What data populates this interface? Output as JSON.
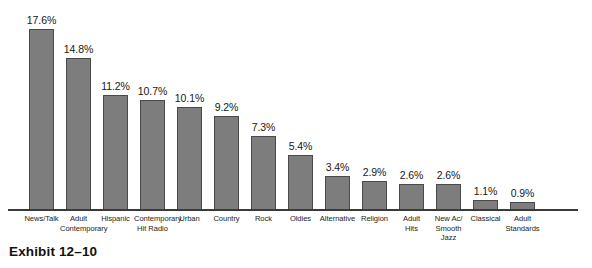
{
  "caption": "Exhibit 12–10",
  "chart_data": {
    "type": "bar",
    "title": "",
    "subtitle": "",
    "xlabel": "",
    "ylabel": "",
    "ylim": [
      0,
      17.6
    ],
    "grid": false,
    "legend": false,
    "value_suffix": "%",
    "bar_color": "#7d7d7d",
    "bar_border_color": "#4a4a4a",
    "axis_color": "#3a3a3a",
    "background": "#ffffff",
    "categories": [
      "News/Talk",
      "Adult Contemporary",
      "Hispanic",
      "Contemporary Hit Radio",
      "Urban",
      "Country",
      "Rock",
      "Oldies",
      "Alternative",
      "Religion",
      "Adult Hits",
      "New Ac/ Smooth Jazz",
      "Classical",
      "Adult Standards"
    ],
    "values": [
      17.6,
      14.8,
      11.2,
      10.7,
      10.1,
      9.2,
      7.3,
      5.4,
      3.4,
      2.9,
      2.6,
      2.6,
      1.1,
      0.9
    ],
    "data_labels": [
      "17.6%",
      "14.8%",
      "11.2%",
      "10.7%",
      "10.1%",
      "9.2%",
      "7.3%",
      "5.4%",
      "3.4%",
      "2.9%",
      "2.6%",
      "2.6%",
      "1.1%",
      "0.9%"
    ],
    "category_label_lines": [
      [
        "News/Talk"
      ],
      [
        "Adult",
        "Contemporary"
      ],
      [
        "Hispanic"
      ],
      [
        "Contemporary",
        "Hit Radio"
      ],
      [
        "Urban"
      ],
      [
        "Country"
      ],
      [
        "Rock"
      ],
      [
        "Oldies"
      ],
      [
        "Alternative"
      ],
      [
        "Religion"
      ],
      [
        "Adult",
        "Hits"
      ],
      [
        "New Ac/",
        "Smooth Jazz"
      ],
      [
        "Classical"
      ],
      [
        "Adult",
        "Standards"
      ]
    ]
  }
}
